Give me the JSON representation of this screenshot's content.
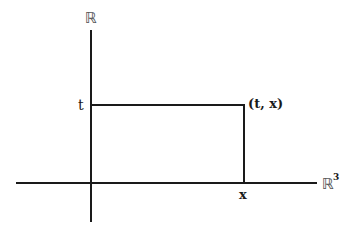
{
  "diagram": {
    "vertical_axis_label": "ℝ",
    "horizontal_axis_label": "ℝ",
    "horizontal_axis_superscript": "3",
    "t_label": "t",
    "x_label": "x",
    "point_label": "(t, x)",
    "colors": {
      "line": "#1a1a1a",
      "background": "#ffffff"
    }
  }
}
